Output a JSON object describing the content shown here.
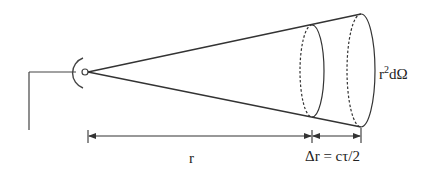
{
  "diagram": {
    "labels": {
      "range": "r",
      "range_resolution": "Δr = cτ/2",
      "area_base": "r",
      "area_exp": "2",
      "area_tail": "dΩ"
    },
    "colors": {
      "stroke": "#333333",
      "background": "#ffffff"
    }
  }
}
